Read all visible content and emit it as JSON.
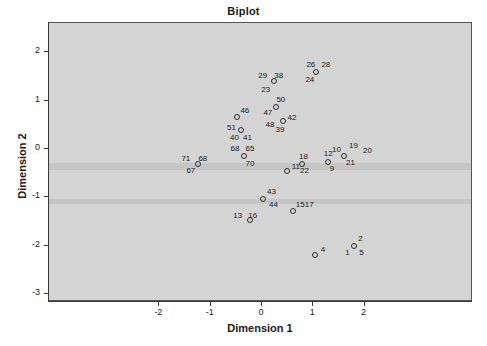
{
  "chart_data": {
    "type": "scatter",
    "title": "Biplot",
    "xlabel": "Dimension 1",
    "ylabel": "Dimension 2",
    "xlim": [
      -2.75,
      2.55
    ],
    "ylim": [
      -3.0,
      2.4
    ],
    "xticks": [
      -2,
      -1,
      0,
      1,
      2
    ],
    "xticklabels": [
      "-2",
      "-1",
      "0",
      "1",
      "2"
    ],
    "yticks": [
      2,
      1,
      0,
      -1,
      -2,
      -3
    ],
    "yticklabels": [
      "2",
      "1",
      "0",
      "-1",
      "-2",
      "-3"
    ],
    "grid": false,
    "legend": "none",
    "marker": "open-circle",
    "panel_color": "#d4d4d4",
    "points": [
      {
        "x": 1.05,
        "y": -2.22,
        "labels": [
          {
            "text": "4",
            "dx": 6,
            "dy": -9
          }
        ]
      },
      {
        "x": 1.82,
        "y": -2.03,
        "labels": [
          {
            "text": "2",
            "dx": 4,
            "dy": -11
          },
          {
            "text": "1",
            "dx": -9,
            "dy": 3
          },
          {
            "text": "5",
            "dx": 5,
            "dy": 3
          }
        ]
      },
      {
        "x": 0.62,
        "y": -1.31,
        "labels": [
          {
            "text": "15",
            "dx": 3,
            "dy": -10
          },
          {
            "text": "17",
            "dx": 12,
            "dy": -10
          }
        ]
      },
      {
        "x": -0.21,
        "y": -1.49,
        "labels": [
          {
            "text": "13",
            "dx": -17,
            "dy": -8
          },
          {
            "text": "16",
            "dx": -2,
            "dy": -8
          }
        ]
      },
      {
        "x": 0.04,
        "y": -1.06,
        "labels": [
          {
            "text": "43",
            "dx": 4,
            "dy": -11
          },
          {
            "text": "44",
            "dx": 6,
            "dy": 2
          }
        ]
      },
      {
        "x": 0.5,
        "y": -0.47,
        "labels": [
          {
            "text": "11",
            "dx": 5,
            "dy": -8
          }
        ]
      },
      {
        "x": 0.8,
        "y": -0.34,
        "labels": [
          {
            "text": "18",
            "dx": -3,
            "dy": -11
          },
          {
            "text": "22",
            "dx": -2,
            "dy": 3
          }
        ]
      },
      {
        "x": 1.3,
        "y": -0.29,
        "labels": [
          {
            "text": "12",
            "dx": -4,
            "dy": -12
          },
          {
            "text": "9",
            "dx": 2,
            "dy": 3
          }
        ]
      },
      {
        "x": 1.62,
        "y": -0.16,
        "labels": [
          {
            "text": "10",
            "dx": -12,
            "dy": -10
          },
          {
            "text": "19",
            "dx": 5,
            "dy": -14
          },
          {
            "text": "21",
            "dx": 2,
            "dy": 3
          },
          {
            "text": "20",
            "dx": 19,
            "dy": -9
          }
        ]
      },
      {
        "x": -0.34,
        "y": -0.16,
        "labels": [
          {
            "text": "68",
            "dx": -13,
            "dy": -11
          },
          {
            "text": "65",
            "dx": 2,
            "dy": -11
          },
          {
            "text": "70",
            "dx": 2,
            "dy": 4
          }
        ]
      },
      {
        "x": -1.22,
        "y": -0.33,
        "labels": [
          {
            "text": "71",
            "dx": -17,
            "dy": -9
          },
          {
            "text": "68",
            "dx": 0,
            "dy": -9
          },
          {
            "text": "67",
            "dx": -12,
            "dy": 3
          }
        ]
      },
      {
        "x": -0.39,
        "y": 0.37,
        "labels": [
          {
            "text": "51",
            "dx": -14,
            "dy": -6
          },
          {
            "text": "40",
            "dx": -11,
            "dy": 4
          },
          {
            "text": "41",
            "dx": 2,
            "dy": 4
          }
        ]
      },
      {
        "x": -0.46,
        "y": 0.65,
        "labels": [
          {
            "text": "46",
            "dx": 3,
            "dy": -10
          }
        ]
      },
      {
        "x": 0.42,
        "y": 0.55,
        "labels": [
          {
            "text": "48",
            "dx": -17,
            "dy": 0
          },
          {
            "text": "39",
            "dx": -7,
            "dy": 5
          },
          {
            "text": "42",
            "dx": 5,
            "dy": -7
          }
        ]
      },
      {
        "x": 0.3,
        "y": 0.85,
        "labels": [
          {
            "text": "50",
            "dx": 0,
            "dy": -11
          },
          {
            "text": "47",
            "dx": -13,
            "dy": 2
          }
        ]
      },
      {
        "x": 0.26,
        "y": 1.38,
        "labels": [
          {
            "text": "29",
            "dx": -16,
            "dy": -9
          },
          {
            "text": "38",
            "dx": 0,
            "dy": -9
          },
          {
            "text": "23",
            "dx": -13,
            "dy": 5
          }
        ]
      },
      {
        "x": 1.08,
        "y": 1.57,
        "labels": [
          {
            "text": "26",
            "dx": -10,
            "dy": -11
          },
          {
            "text": "28",
            "dx": 5,
            "dy": -11
          },
          {
            "text": "24",
            "dx": -11,
            "dy": 4
          }
        ]
      }
    ]
  }
}
